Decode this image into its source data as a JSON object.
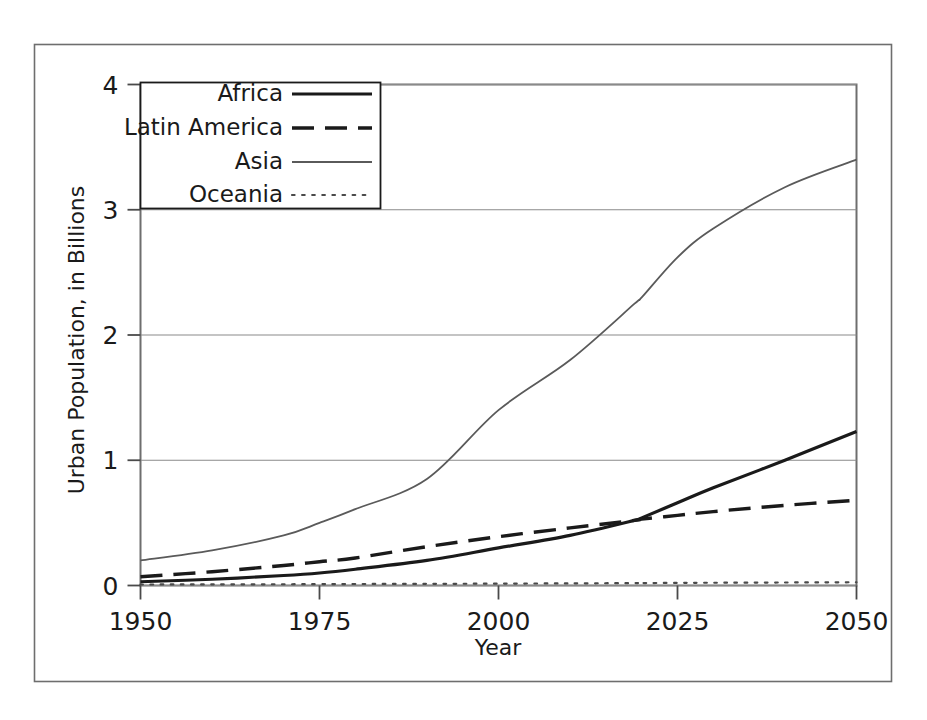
{
  "chart_data": {
    "type": "line",
    "title": "",
    "xlabel": "Year",
    "ylabel": "Urban Population, in Billions",
    "xlim": [
      1950,
      2050
    ],
    "ylim": [
      0,
      4
    ],
    "xticks": [
      "1950",
      "1975",
      "2000",
      "2025",
      "2050"
    ],
    "xtick_values": [
      1950,
      1975,
      2000,
      2025,
      2050
    ],
    "yticks": [
      "0",
      "1",
      "2",
      "3",
      "4"
    ],
    "ytick_values": [
      0,
      1,
      2,
      3,
      4
    ],
    "grid": "horizontal",
    "legend_position": "top-left",
    "x": [
      1950,
      1960,
      1970,
      1975,
      1980,
      1990,
      2000,
      2010,
      2019,
      2020,
      2025,
      2030,
      2040,
      2050
    ],
    "series": [
      {
        "name": "Africa",
        "style": "solid",
        "color": "#1a1a1a",
        "width": 3.2,
        "values": [
          0.03,
          0.05,
          0.08,
          0.1,
          0.13,
          0.2,
          0.3,
          0.4,
          0.52,
          0.54,
          0.66,
          0.78,
          1.0,
          1.23
        ]
      },
      {
        "name": "Latin America",
        "style": "dashed",
        "color": "#1a1a1a",
        "width": 3.4,
        "values": [
          0.07,
          0.11,
          0.16,
          0.19,
          0.22,
          0.31,
          0.39,
          0.46,
          0.52,
          0.53,
          0.56,
          0.59,
          0.64,
          0.68
        ]
      },
      {
        "name": "Asia",
        "style": "thin",
        "color": "#5a5a5a",
        "width": 1.8,
        "values": [
          0.2,
          0.28,
          0.4,
          0.5,
          0.61,
          0.85,
          1.4,
          1.8,
          2.25,
          2.3,
          2.62,
          2.85,
          3.18,
          3.4
        ]
      },
      {
        "name": "Oceania",
        "style": "dotted",
        "color": "#4a4a4a",
        "width": 2.2,
        "values": [
          0.008,
          0.009,
          0.01,
          0.011,
          0.012,
          0.013,
          0.015,
          0.017,
          0.019,
          0.019,
          0.021,
          0.022,
          0.024,
          0.026
        ]
      }
    ]
  },
  "legend": {
    "items": [
      {
        "label": "Africa",
        "style": "solid"
      },
      {
        "label": "Latin America",
        "style": "dashed"
      },
      {
        "label": "Asia",
        "style": "thin"
      },
      {
        "label": "Oceania",
        "style": "dotted"
      }
    ]
  },
  "axes": {
    "x_title": "Year",
    "y_title": "Urban Population, in Billions",
    "x_tick_labels": [
      "1950",
      "1975",
      "2000",
      "2025",
      "2050"
    ],
    "y_tick_labels": [
      "0",
      "1",
      "2",
      "3",
      "4"
    ]
  },
  "colors": {
    "frame": "#6e6e6e",
    "grid": "#8a8a8a",
    "text": "#1a1a1a",
    "asia_line": "#5a5a5a",
    "background": "#ffffff"
  }
}
